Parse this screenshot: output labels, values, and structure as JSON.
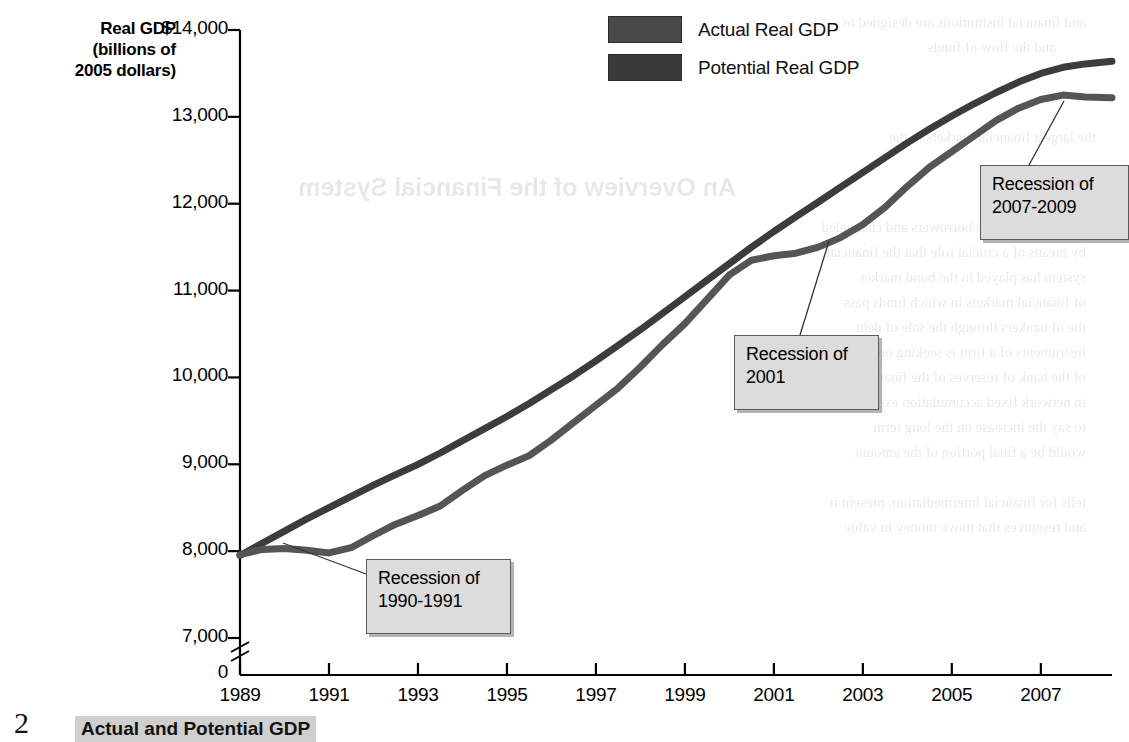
{
  "figure": {
    "number": "2",
    "caption": "Actual and Potential GDP"
  },
  "axis_title": {
    "line1": "Real GDP",
    "line2": "(billions of",
    "line3": "2005 dollars)"
  },
  "legend": {
    "items": [
      {
        "label": "Actual Real GDP",
        "color": "#4a4a4a"
      },
      {
        "label": "Potential Real GDP",
        "color": "#3a3a3a"
      }
    ]
  },
  "callouts": [
    {
      "name": "recession-1990-1991",
      "text": "Recession of\n1990-1991",
      "x": 366,
      "y": 559,
      "w": 122,
      "h": 58,
      "leader": {
        "x1": 366,
        "y1": 574,
        "x2": 283,
        "y2": 543
      }
    },
    {
      "name": "recession-2001",
      "text": "Recession of\n2001",
      "x": 734,
      "y": 335,
      "w": 122,
      "h": 58,
      "leader": {
        "x1": 800,
        "y1": 335,
        "x2": 829,
        "y2": 241
      }
    },
    {
      "name": "recession-2007-2009",
      "text": "Recession of\n2007-2009",
      "x": 980,
      "y": 165,
      "w": 126,
      "h": 58,
      "leader": {
        "x1": 1029,
        "y1": 165,
        "x2": 1064,
        "y2": 101
      }
    }
  ],
  "chart_data": {
    "type": "line",
    "title": "Actual and Potential GDP",
    "xlabel": "",
    "ylabel": "Real GDP (billions of 2005 dollars)",
    "xlim": [
      1989,
      2008.6
    ],
    "ylim": [
      7000,
      14000
    ],
    "axis_break_below": 7000,
    "grid": false,
    "legend_position": "top-center",
    "xticks": [
      1989,
      1991,
      1993,
      1995,
      1997,
      1999,
      2001,
      2003,
      2005,
      2007
    ],
    "yticks": [
      7000,
      8000,
      9000,
      10000,
      11000,
      12000,
      13000,
      14000
    ],
    "ytick_labels": [
      "7,000",
      "8,000",
      "9,000",
      "10,000",
      "11,000",
      "12,000",
      "13,000",
      "$14,000"
    ],
    "zero_label": "0",
    "x": [
      1989.0,
      1989.5,
      1990.0,
      1990.5,
      1991.0,
      1991.5,
      1992.0,
      1992.5,
      1993.0,
      1993.5,
      1994.0,
      1994.5,
      1995.0,
      1995.5,
      1996.0,
      1996.5,
      1997.0,
      1997.5,
      1998.0,
      1998.5,
      1999.0,
      1999.5,
      2000.0,
      2000.5,
      2001.0,
      2001.5,
      2002.0,
      2002.5,
      2003.0,
      2003.5,
      2004.0,
      2004.5,
      2005.0,
      2005.5,
      2006.0,
      2006.5,
      2007.0,
      2007.5,
      2008.0,
      2008.6
    ],
    "series": [
      {
        "name": "Actual Real GDP",
        "color": "#555555",
        "values": [
          7960,
          8020,
          8030,
          8010,
          7980,
          8040,
          8180,
          8310,
          8410,
          8520,
          8700,
          8870,
          8990,
          9100,
          9280,
          9480,
          9680,
          9880,
          10120,
          10380,
          10620,
          10900,
          11180,
          11350,
          11400,
          11430,
          11500,
          11610,
          11760,
          11960,
          12200,
          12420,
          12600,
          12780,
          12960,
          13100,
          13200,
          13250,
          13230,
          13220
        ]
      },
      {
        "name": "Potential Real GDP",
        "color": "#3c3c3c",
        "values": [
          7950,
          8090,
          8230,
          8370,
          8500,
          8630,
          8760,
          8880,
          9000,
          9130,
          9270,
          9410,
          9550,
          9700,
          9860,
          10020,
          10190,
          10370,
          10550,
          10740,
          10930,
          11120,
          11310,
          11500,
          11680,
          11850,
          12020,
          12190,
          12360,
          12530,
          12700,
          12860,
          13010,
          13150,
          13280,
          13400,
          13500,
          13570,
          13610,
          13640
        ]
      }
    ],
    "annotations": [
      "Recession of 1990-1991",
      "Recession of 2001",
      "Recession of 2007-2009"
    ]
  }
}
